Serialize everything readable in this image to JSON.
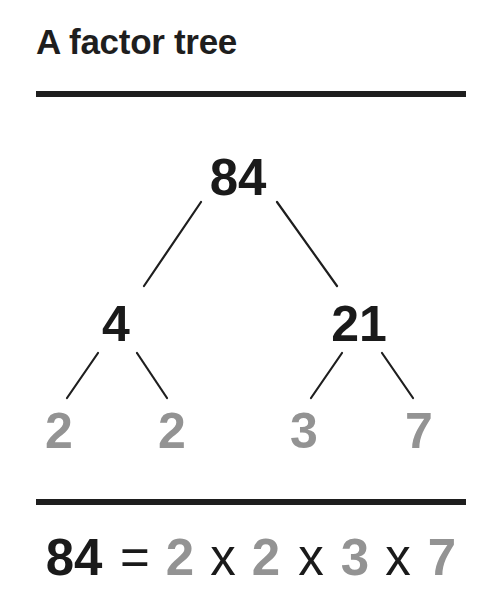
{
  "title": "A factor tree",
  "colors": {
    "text_dark": "#1a1a1a",
    "prime_gray": "#939393",
    "rule": "#1e1e1e",
    "background": "#ffffff"
  },
  "tree": {
    "root": {
      "value": "84",
      "composite": true
    },
    "level1": [
      {
        "value": "4",
        "composite": true,
        "parent": "84"
      },
      {
        "value": "21",
        "composite": true,
        "parent": "84"
      }
    ],
    "level2": [
      {
        "value": "2",
        "prime": true,
        "parent": "4"
      },
      {
        "value": "2",
        "prime": true,
        "parent": "4"
      },
      {
        "value": "3",
        "prime": true,
        "parent": "21"
      },
      {
        "value": "7",
        "prime": true,
        "parent": "21"
      }
    ]
  },
  "equation": {
    "number": "84",
    "equals": "=",
    "factors": [
      "2",
      "2",
      "3",
      "7"
    ],
    "operators": [
      "x",
      "x",
      "x"
    ]
  }
}
